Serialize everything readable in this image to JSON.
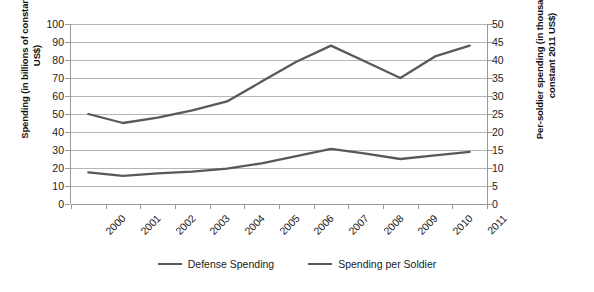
{
  "chart_data": {
    "type": "line",
    "title": "",
    "subtitle": "",
    "xlabel": "",
    "ylabel": "Spending (in billions of constant 2011 US$)",
    "y2label": "Per-soldier spending (in thousands of constant 2011 US$)",
    "x": [
      "2000",
      "2001",
      "2002",
      "2003",
      "2004",
      "2005",
      "2006",
      "2007",
      "2008",
      "2009",
      "2010",
      "2011"
    ],
    "categories": [
      "2000",
      "2001",
      "2002",
      "2003",
      "2004",
      "2005",
      "2006",
      "2007",
      "2008",
      "2009",
      "2010",
      "2011"
    ],
    "ylim": [
      0,
      100
    ],
    "y_ticks": [
      0,
      10,
      20,
      30,
      40,
      50,
      60,
      70,
      80,
      90,
      100
    ],
    "y2lim": [
      0,
      50
    ],
    "y2_ticks": [
      0,
      5,
      10,
      15,
      20,
      25,
      30,
      35,
      40,
      45,
      50
    ],
    "grid": true,
    "legend_position": "bottom",
    "series": [
      {
        "name": "Defense Spending",
        "axis": "left",
        "color": "#595959",
        "values": [
          50,
          45,
          48,
          52,
          57,
          68,
          79,
          88,
          79,
          70,
          82,
          88
        ]
      },
      {
        "name": "Spending per Soldier",
        "axis": "right",
        "color": "#595959",
        "values": [
          8.8,
          7.8,
          8.5,
          9.0,
          9.8,
          11.3,
          13.3,
          15.3,
          14.0,
          12.5,
          13.5,
          14.5
        ]
      }
    ]
  },
  "legend": {
    "items": [
      {
        "label": "Defense Spending",
        "color": "#595959"
      },
      {
        "label": "Spending per Soldier",
        "color": "#595959"
      }
    ]
  },
  "axes": {
    "left_title": "Spending (in billions of constant 2011 US$)",
    "right_title": "Per-soldier spending (in thousands of constant 2011 US$)",
    "left_ticks": [
      "100",
      "90",
      "80",
      "70",
      "60",
      "50",
      "40",
      "30",
      "20",
      "10",
      "0"
    ],
    "right_ticks": [
      "50",
      "45",
      "40",
      "35",
      "30",
      "25",
      "20",
      "15",
      "10",
      "5",
      "0"
    ],
    "x_ticks": [
      "2000",
      "2001",
      "2002",
      "2003",
      "2004",
      "2005",
      "2006",
      "2007",
      "2008",
      "2009",
      "2010",
      "2011"
    ]
  },
  "colors": {
    "series_line": "#595959",
    "gridline": "#b6b6b6",
    "axis_line": "#9a9a9a",
    "text": "#1a1a1a",
    "background": "#ffffff"
  }
}
